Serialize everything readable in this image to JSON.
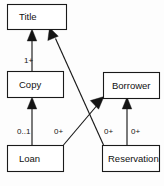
{
  "diagram": {
    "type": "uml-class-diagram",
    "background_color": "#fdfdfd",
    "line_color": "#1a1a1a",
    "text_color": "#111111",
    "classes": [
      {
        "id": "title",
        "label": "Title",
        "x": 7,
        "y": 4,
        "w": 60,
        "h": 26
      },
      {
        "id": "copy",
        "label": "Copy",
        "x": 7,
        "y": 71,
        "w": 57,
        "h": 27
      },
      {
        "id": "loan",
        "label": "Loan",
        "x": 7,
        "y": 145,
        "w": 57,
        "h": 27
      },
      {
        "id": "borrower",
        "label": "Borrower",
        "x": 103,
        "y": 72,
        "w": 57,
        "h": 27
      },
      {
        "id": "reservation",
        "label": "Reservation",
        "x": 102,
        "y": 145,
        "w": 58,
        "h": 27
      }
    ],
    "relationships": [
      {
        "id": "copy-to-title",
        "from": "copy",
        "to": "title",
        "multiplicity": "1+",
        "label_x": 24,
        "label_y": 61
      },
      {
        "id": "loan-to-copy",
        "from": "loan",
        "to": "copy",
        "multiplicity": "0..1",
        "label_x": 17,
        "label_y": 132
      },
      {
        "id": "loan-to-borrower",
        "from": "loan",
        "to": "borrower",
        "multiplicity": "0+",
        "label_x": 54,
        "label_y": 132
      },
      {
        "id": "reservation-to-title",
        "from": "reservation",
        "to": "title",
        "multiplicity": "0+",
        "label_x": 104,
        "label_y": 132
      },
      {
        "id": "reservation-to-borrower",
        "from": "reservation",
        "to": "borrower",
        "multiplicity": "0+",
        "label_x": 131,
        "label_y": 132
      }
    ]
  }
}
